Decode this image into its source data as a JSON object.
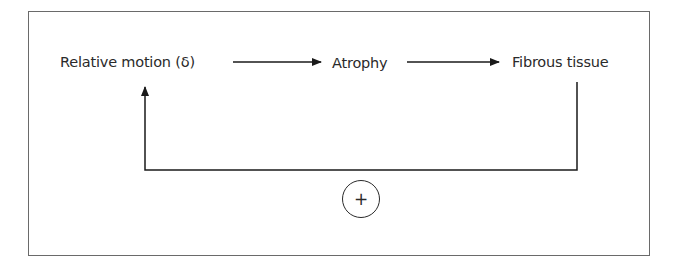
{
  "diagram": {
    "type": "feedback-loop",
    "nodes": [
      {
        "id": "relative-motion",
        "label": "Relative motion (δ)"
      },
      {
        "id": "atrophy",
        "label": "Atrophy"
      },
      {
        "id": "fibrous-tissue",
        "label": "Fibrous tissue"
      }
    ],
    "edges": [
      {
        "from": "relative-motion",
        "to": "atrophy"
      },
      {
        "from": "atrophy",
        "to": "fibrous-tissue"
      },
      {
        "from": "fibrous-tissue",
        "to": "relative-motion",
        "kind": "feedback"
      }
    ],
    "feedback_sign": "+",
    "colors": {
      "line": "#1a1a1a",
      "text": "#2a2a2a",
      "frame": "#6a6a6a",
      "background": "#ffffff"
    }
  }
}
